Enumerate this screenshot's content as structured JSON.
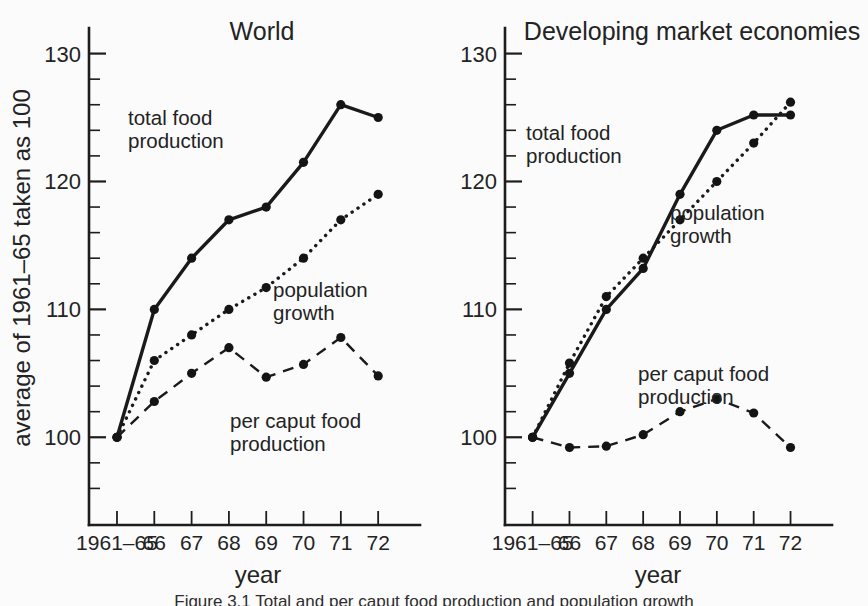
{
  "figure": {
    "y_axis_label": "average of 1961–65 taken as 100",
    "x_axis_label_left": "year",
    "x_axis_label_right": "year",
    "caption": "Figure 3.1   Total and per caput food production and population growth"
  },
  "panels": {
    "left": {
      "title": "World",
      "labels": {
        "total": "total food\nproduction",
        "total_line1": "total food",
        "total_line2": "production",
        "population_line1": "population",
        "population_line2": "growth",
        "percaput_line1": "per caput food",
        "percaput_line2": "production"
      }
    },
    "right": {
      "title": "Developing market economies",
      "labels": {
        "total_line1": "total food",
        "total_line2": "production",
        "population_line1": "population",
        "population_line2": "growth",
        "percaput_line1": "per caput food",
        "percaput_line2": "production"
      }
    }
  },
  "axis": {
    "y_ticks_major": [
      "100",
      "110",
      "120",
      "130"
    ],
    "y_ticks_major_values": [
      100,
      110,
      120,
      130
    ],
    "y_minor_step": 2,
    "ylim": [
      94,
      132
    ],
    "x_tick_labels": [
      "1961–65",
      "66",
      "67",
      "68",
      "69",
      "70",
      "71",
      "72"
    ]
  },
  "chart_data": [
    {
      "type": "line",
      "title": "World",
      "xlabel": "year",
      "ylabel": "average of 1961–65 taken as 100",
      "categories": [
        "1961-65",
        "66",
        "67",
        "68",
        "69",
        "70",
        "71",
        "72"
      ],
      "ylim": [
        94,
        132
      ],
      "grid": false,
      "legend": "inline-annotations",
      "series": [
        {
          "name": "total food production",
          "style": "solid",
          "values": [
            100,
            110,
            114,
            117,
            118,
            121.5,
            126,
            125
          ]
        },
        {
          "name": "population growth",
          "style": "dotted",
          "values": [
            100,
            106,
            108,
            110,
            111.7,
            114,
            117,
            119
          ]
        },
        {
          "name": "per caput food production",
          "style": "dashed",
          "values": [
            100,
            102.8,
            105,
            107,
            104.7,
            105.7,
            107.8,
            104.8
          ]
        }
      ]
    },
    {
      "type": "line",
      "title": "Developing market economies",
      "xlabel": "year",
      "ylabel": "average of 1961–65 taken as 100",
      "categories": [
        "1961-65",
        "66",
        "67",
        "68",
        "69",
        "70",
        "71",
        "72"
      ],
      "ylim": [
        94,
        132
      ],
      "grid": false,
      "legend": "inline-annotations",
      "series": [
        {
          "name": "total food production",
          "style": "solid",
          "values": [
            100,
            105,
            110,
            113.2,
            119,
            124,
            125.2,
            125.2
          ]
        },
        {
          "name": "population growth",
          "style": "dotted",
          "values": [
            100,
            105.8,
            111,
            114,
            117,
            120,
            123,
            126.2
          ]
        },
        {
          "name": "per caput food production",
          "style": "dashed",
          "values": [
            100,
            99.2,
            99.3,
            100.2,
            102,
            103,
            101.9,
            99.2
          ]
        }
      ]
    }
  ]
}
